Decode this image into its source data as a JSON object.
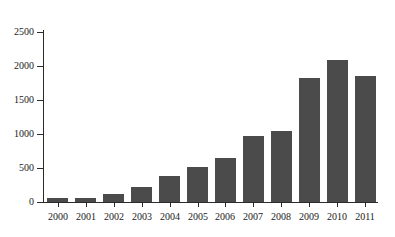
{
  "chart_data": {
    "type": "bar",
    "title": "",
    "subtitle": "",
    "xlabel": "",
    "ylabel": "",
    "categories": [
      "2000",
      "2001",
      "2002",
      "2003",
      "2004",
      "2005",
      "2006",
      "2007",
      "2008",
      "2009",
      "2010",
      "2011"
    ],
    "values": [
      60,
      60,
      120,
      215,
      375,
      510,
      650,
      970,
      1050,
      1820,
      2090,
      1860
    ],
    "series": [
      {
        "name": "",
        "values": [
          60,
          60,
          120,
          215,
          375,
          510,
          650,
          970,
          1050,
          1820,
          2090,
          1860
        ]
      }
    ],
    "ylim": [
      0,
      2500
    ],
    "yticks": [
      0,
      500,
      1000,
      1500,
      2000,
      2500
    ],
    "ytick_labels": [
      "0",
      "500",
      "1000",
      "1500",
      "2000",
      "2500"
    ],
    "xtick_labels": [
      "2000",
      "2001",
      "2002",
      "2003",
      "2004",
      "2005",
      "2006",
      "2007",
      "2008",
      "2009",
      "2010",
      "2011"
    ],
    "grid": false,
    "legend": false,
    "legend_position": "none",
    "bar_color": "#4b4b4b",
    "axis_color": "#2b2b2b",
    "background_color": "#ffffff",
    "annotations": []
  },
  "axis": {
    "y_ticks": [
      {
        "label": "2500",
        "value": 2500
      },
      {
        "label": "2000",
        "value": 2000
      },
      {
        "label": "1500",
        "value": 1500
      },
      {
        "label": "1000",
        "value": 1000
      },
      {
        "label": "500",
        "value": 500
      },
      {
        "label": "0",
        "value": 0
      }
    ],
    "x_ticks": [
      {
        "label": "2000",
        "value": 60
      },
      {
        "label": "2001",
        "value": 60
      },
      {
        "label": "2002",
        "value": 120
      },
      {
        "label": "2003",
        "value": 215
      },
      {
        "label": "2004",
        "value": 375
      },
      {
        "label": "2005",
        "value": 510
      },
      {
        "label": "2006",
        "value": 650
      },
      {
        "label": "2007",
        "value": 970
      },
      {
        "label": "2008",
        "value": 1050
      },
      {
        "label": "2009",
        "value": 1820
      },
      {
        "label": "2010",
        "value": 2090
      },
      {
        "label": "2011",
        "value": 1860
      }
    ]
  }
}
